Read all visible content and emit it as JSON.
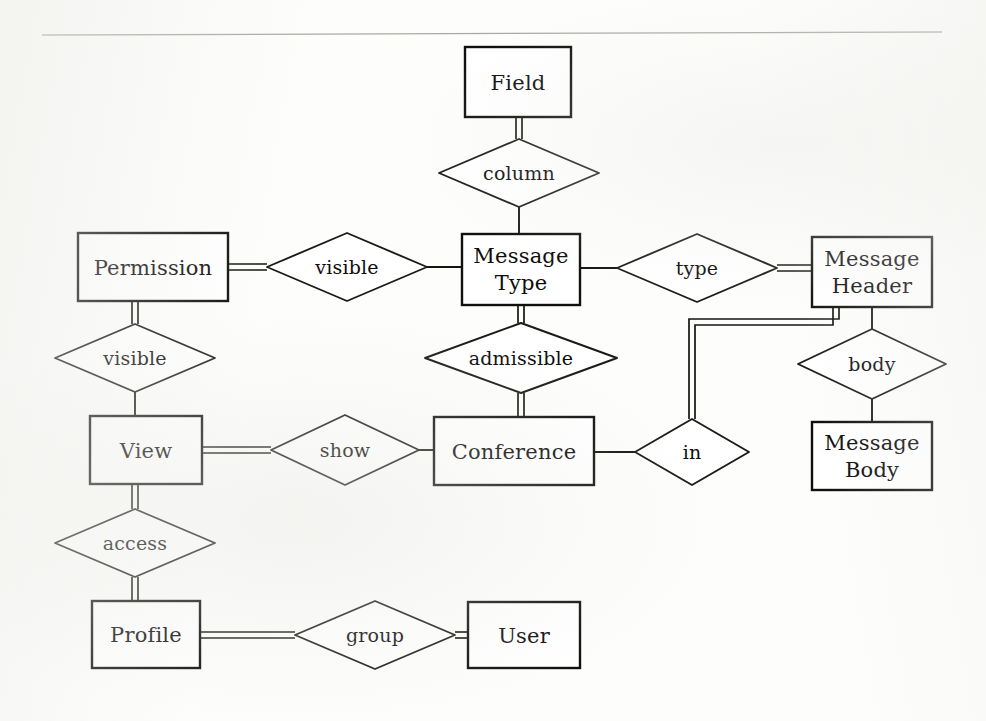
{
  "diagram": {
    "notation": "chen",
    "stroke_color": "#15150f",
    "fill_color": "#ffffff",
    "background_color": "#fdfdfc",
    "entities": [
      {
        "id": "field",
        "label": "Field",
        "lines": [
          "Field"
        ],
        "x": 465,
        "y": 47,
        "w": 106,
        "h": 70
      },
      {
        "id": "permission",
        "label": "Permission",
        "lines": [
          "Permission"
        ],
        "x": 78,
        "y": 233,
        "w": 150,
        "h": 68
      },
      {
        "id": "message_type",
        "label": "Message Type",
        "lines": [
          "Message",
          "Type"
        ],
        "x": 462,
        "y": 234,
        "w": 118,
        "h": 71
      },
      {
        "id": "message_header",
        "label": "Message Header",
        "lines": [
          "Message",
          "Header"
        ],
        "x": 812,
        "y": 237,
        "w": 120,
        "h": 70
      },
      {
        "id": "view",
        "label": "View",
        "lines": [
          "View"
        ],
        "x": 90,
        "y": 416,
        "w": 112,
        "h": 68
      },
      {
        "id": "conference",
        "label": "Conference",
        "lines": [
          "Conference"
        ],
        "x": 434,
        "y": 417,
        "w": 160,
        "h": 68
      },
      {
        "id": "message_body",
        "label": "Message Body",
        "lines": [
          "Message",
          "Body"
        ],
        "x": 812,
        "y": 422,
        "w": 120,
        "h": 68
      },
      {
        "id": "profile",
        "label": "Profile",
        "lines": [
          "Profile"
        ],
        "x": 92,
        "y": 601,
        "w": 108,
        "h": 67
      },
      {
        "id": "user",
        "label": "User",
        "lines": [
          "User"
        ],
        "x": 468,
        "y": 602,
        "w": 112,
        "h": 66
      }
    ],
    "relationships": [
      {
        "id": "column",
        "label": "column",
        "cx": 519,
        "cy": 173,
        "rx": 80,
        "ry": 34
      },
      {
        "id": "visible_pm",
        "label": "visible",
        "cx": 347,
        "cy": 267,
        "rx": 80,
        "ry": 34
      },
      {
        "id": "type",
        "label": "type",
        "cx": 697,
        "cy": 268,
        "rx": 80,
        "ry": 34
      },
      {
        "id": "visible_pv",
        "label": "visible",
        "cx": 135,
        "cy": 358,
        "rx": 80,
        "ry": 34
      },
      {
        "id": "admissible",
        "label": "admissible",
        "cx": 521,
        "cy": 358,
        "rx": 96,
        "ry": 35
      },
      {
        "id": "body",
        "label": "body",
        "cx": 872,
        "cy": 364,
        "rx": 74,
        "ry": 35
      },
      {
        "id": "show",
        "label": "show",
        "cx": 345,
        "cy": 450,
        "rx": 74,
        "ry": 35
      },
      {
        "id": "in",
        "label": "in",
        "cx": 692,
        "cy": 452,
        "rx": 57,
        "ry": 33
      },
      {
        "id": "access",
        "label": "access",
        "cx": 135,
        "cy": 543,
        "rx": 80,
        "ry": 34
      },
      {
        "id": "group",
        "label": "group",
        "cx": 375,
        "cy": 635,
        "rx": 80,
        "ry": 34
      }
    ],
    "connections": [
      {
        "from": "field",
        "to": "column",
        "style": "double"
      },
      {
        "from": "column",
        "to": "message_type",
        "style": "single"
      },
      {
        "from": "permission",
        "to": "visible_pm",
        "style": "double"
      },
      {
        "from": "visible_pm",
        "to": "message_type",
        "style": "single"
      },
      {
        "from": "message_type",
        "to": "type",
        "style": "single"
      },
      {
        "from": "type",
        "to": "message_header",
        "style": "double"
      },
      {
        "from": "permission",
        "to": "visible_pv",
        "style": "double"
      },
      {
        "from": "visible_pv",
        "to": "view",
        "style": "single"
      },
      {
        "from": "message_type",
        "to": "admissible",
        "style": "double"
      },
      {
        "from": "admissible",
        "to": "conference",
        "style": "double"
      },
      {
        "from": "message_header",
        "to": "body",
        "style": "single"
      },
      {
        "from": "body",
        "to": "message_body",
        "style": "single"
      },
      {
        "from": "view",
        "to": "show",
        "style": "double"
      },
      {
        "from": "show",
        "to": "conference",
        "style": "single"
      },
      {
        "from": "conference",
        "to": "in",
        "style": "single"
      },
      {
        "from": "in",
        "to": "message_header",
        "style": "double"
      },
      {
        "from": "view",
        "to": "access",
        "style": "double"
      },
      {
        "from": "access",
        "to": "profile",
        "style": "double"
      },
      {
        "from": "profile",
        "to": "group",
        "style": "double"
      },
      {
        "from": "group",
        "to": "user",
        "style": "double"
      }
    ]
  },
  "labels": {
    "field": "Field",
    "column": "column",
    "permission": "Permission",
    "visible_top": "visible",
    "visible_left": "visible",
    "message_type_l1": "Message",
    "message_type_l2": "Type",
    "type": "type",
    "message_header_l1": "Message",
    "message_header_l2": "Header",
    "admissible": "admissible",
    "body": "body",
    "view": "View",
    "show": "show",
    "conference": "Conference",
    "in": "in",
    "message_body_l1": "Message",
    "message_body_l2": "Body",
    "access": "access",
    "profile": "Profile",
    "group": "group",
    "user": "User"
  }
}
